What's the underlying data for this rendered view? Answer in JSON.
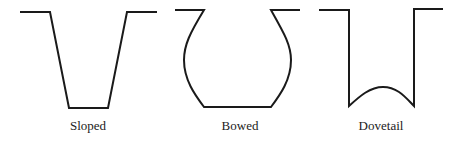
{
  "diagram": {
    "stroke_color": "#1a1a1a",
    "shapes": [
      {
        "name": "sloped",
        "label": "Sloped"
      },
      {
        "name": "bowed",
        "label": "Bowed"
      },
      {
        "name": "dovetail",
        "label": "Dovetail"
      }
    ]
  }
}
